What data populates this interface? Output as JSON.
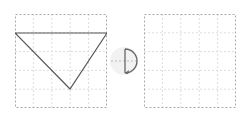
{
  "diagram": {
    "type": "rotation-transformation",
    "grid": {
      "rows": 5,
      "cols": 5,
      "line_color": "#dddddd",
      "border_color": "#999999"
    },
    "left_grid": {
      "shape": "inverted-triangle",
      "vertices_grid_units": [
        [
          0,
          1
        ],
        [
          5,
          1
        ],
        [
          3,
          4
        ]
      ],
      "stroke_color": "#555555"
    },
    "rotation_icon": {
      "description": "half-turn clockwise rotation arrow",
      "bg_color": "#eeeeee",
      "stroke_color": "#666666"
    },
    "right_grid": {
      "shape": null
    }
  }
}
